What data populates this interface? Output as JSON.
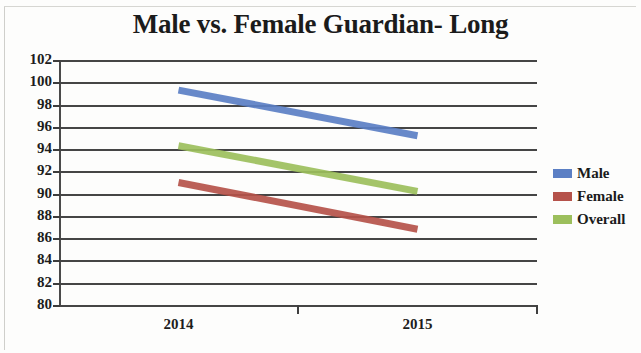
{
  "chart_data": {
    "type": "line",
    "title": "Male vs. Female Guardian- Long",
    "xlabel": "",
    "ylabel": "",
    "categories": [
      "2014",
      "2015"
    ],
    "x": [
      "2014",
      "2015"
    ],
    "series": [
      {
        "name": "Male",
        "values": [
          99.3,
          95.2
        ],
        "color": "#5b7fc4"
      },
      {
        "name": "Female",
        "values": [
          91.0,
          86.8
        ],
        "color": "#b5524a"
      },
      {
        "name": "Overall",
        "values": [
          94.3,
          90.2
        ],
        "color": "#9cbf5c"
      }
    ],
    "ylim": [
      80,
      102
    ],
    "ytick_step": 2,
    "yticks": [
      102,
      100,
      98,
      96,
      94,
      92,
      90,
      88,
      86,
      84,
      82,
      80
    ],
    "grid": true,
    "legend_position": "right",
    "annotations": []
  },
  "legend": {
    "entries": [
      {
        "label": "Male",
        "color": "#5b7fc4"
      },
      {
        "label": "Female",
        "color": "#b5524a"
      },
      {
        "label": "Overall",
        "color": "#9cbf5c"
      }
    ]
  },
  "axes": {
    "y_labels": [
      "102",
      "100",
      "98",
      "96",
      "94",
      "92",
      "90",
      "88",
      "86",
      "84",
      "82",
      "80"
    ],
    "x_labels": [
      "2014",
      "2015"
    ]
  }
}
